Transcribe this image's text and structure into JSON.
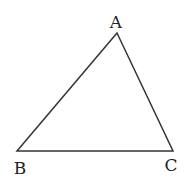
{
  "diagram": {
    "type": "triangle",
    "stroke_color": "#333333",
    "vertices": [
      {
        "label": "A",
        "x": 117,
        "y": 33,
        "label_x": 116,
        "label_y": 28
      },
      {
        "label": "B",
        "x": 17,
        "y": 151,
        "label_x": 20,
        "label_y": 174
      },
      {
        "label": "C",
        "x": 173,
        "y": 151,
        "label_x": 171,
        "label_y": 171
      }
    ]
  }
}
